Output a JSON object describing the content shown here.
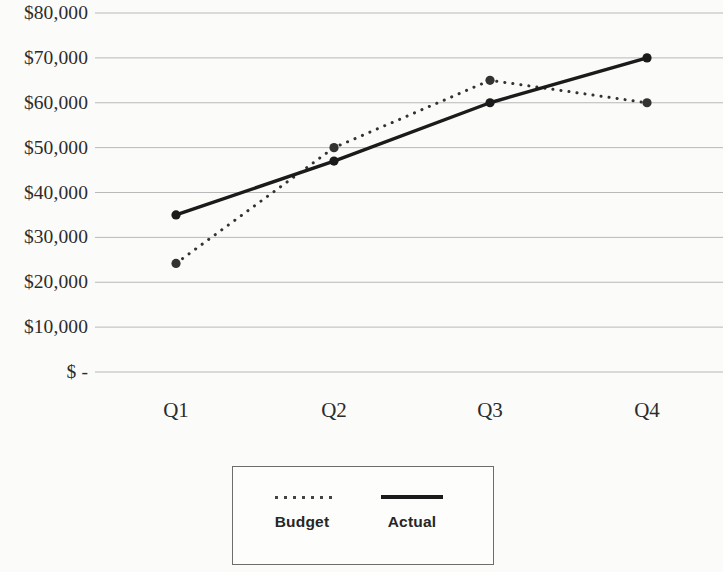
{
  "chart_data": {
    "type": "line",
    "title": "",
    "subtitle": "",
    "xlabel": "",
    "ylabel": "",
    "categories": [
      "Q1",
      "Q2",
      "Q3",
      "Q4"
    ],
    "series": [
      {
        "name": "Budget",
        "style": "dotted",
        "color": "#333333",
        "values": [
          24200,
          50000,
          65000,
          60000
        ]
      },
      {
        "name": "Actual",
        "style": "solid",
        "color": "#1b1b1b",
        "values": [
          35000,
          47000,
          60000,
          70000
        ]
      }
    ],
    "ylim": [
      0,
      80000
    ],
    "ytick_values": [
      0,
      10000,
      20000,
      30000,
      40000,
      50000,
      60000,
      70000,
      80000
    ],
    "ytick_labels": [
      "$ -",
      "$10,000",
      "$20,000",
      "$30,000",
      "$40,000",
      "$50,000",
      "$60,000",
      "$70,000",
      "$80,000"
    ],
    "xtick_labels": [
      "Q1",
      "Q2",
      "Q3",
      "Q4"
    ],
    "grid": true,
    "grid_axis": "y",
    "grid_color": "#b9b9b9",
    "legend_position": "bottom",
    "legend_entries": [
      "Budget",
      "Actual"
    ],
    "markers": true,
    "marker_shape": "circle",
    "background_color": "#fbfbfa"
  },
  "legend": {
    "budget_label": "Budget",
    "actual_label": "Actual"
  }
}
